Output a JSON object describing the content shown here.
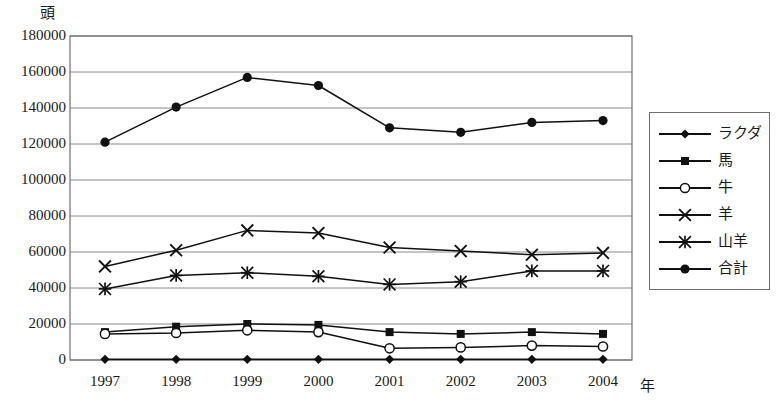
{
  "chart_data": {
    "type": "line",
    "title": "",
    "xlabel": "年",
    "ylabel": "頭",
    "x": [
      "1997",
      "1998",
      "1999",
      "2000",
      "2001",
      "2002",
      "2003",
      "2004"
    ],
    "categories": [
      "1997",
      "1998",
      "1999",
      "2000",
      "2001",
      "2002",
      "2003",
      "2004"
    ],
    "ylim": [
      0,
      180000
    ],
    "ytick_step": 20000,
    "yticks": [
      "0",
      "20000",
      "40000",
      "60000",
      "80000",
      "100000",
      "120000",
      "140000",
      "160000",
      "180000"
    ],
    "ytick_values": [
      0,
      20000,
      40000,
      60000,
      80000,
      100000,
      120000,
      140000,
      160000,
      180000
    ],
    "grid": "horizontal",
    "legend_position": "right-outside",
    "series": [
      {
        "name": "ラクダ",
        "marker": "diamond-filled",
        "values": [
          350,
          400,
          400,
          400,
          350,
          350,
          350,
          350
        ]
      },
      {
        "name": "馬",
        "marker": "square-filled",
        "values": [
          15500,
          18500,
          20000,
          19500,
          15500,
          14500,
          15500,
          14500
        ]
      },
      {
        "name": "牛",
        "marker": "circle-open",
        "values": [
          14500,
          15000,
          16500,
          15500,
          6500,
          7000,
          8000,
          7500
        ]
      },
      {
        "name": "羊",
        "marker": "cross-x",
        "values": [
          52000,
          61000,
          72000,
          70500,
          62500,
          60500,
          58500,
          59500
        ]
      },
      {
        "name": "山羊",
        "marker": "asterisk",
        "values": [
          39500,
          47000,
          48500,
          46500,
          42000,
          43500,
          49500,
          49500
        ]
      },
      {
        "name": "合計",
        "marker": "circle-filled",
        "values": [
          121000,
          140500,
          157000,
          152500,
          129000,
          126500,
          132000,
          133000
        ]
      }
    ]
  },
  "colors": {
    "line": "#111111",
    "grid": "#8a8a8a",
    "frame": "#6f6f6f",
    "text": "#1a1a1a",
    "background": "#ffffff"
  },
  "legend": {
    "items": [
      {
        "label": "ラクダ"
      },
      {
        "label": "馬"
      },
      {
        "label": "牛"
      },
      {
        "label": "羊"
      },
      {
        "label": "山羊"
      },
      {
        "label": "合計"
      }
    ]
  }
}
